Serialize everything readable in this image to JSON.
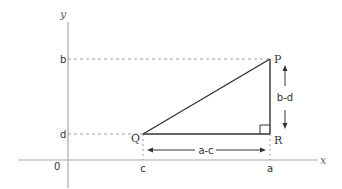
{
  "diagram": {
    "type": "right-triangle-coordinate-distance",
    "axes": {
      "x_label": "x",
      "y_label": "y",
      "origin_label": "0"
    },
    "ticks": {
      "x": [
        {
          "label": "c",
          "value_ref": "Q.x"
        },
        {
          "label": "a",
          "value_ref": "P.x"
        }
      ],
      "y": [
        {
          "label": "b",
          "value_ref": "P.y"
        },
        {
          "label": "d",
          "value_ref": "Q.y"
        }
      ]
    },
    "points": {
      "P": {
        "label": "P",
        "coords": "(a, b)"
      },
      "Q": {
        "label": "Q",
        "coords": "(c, d)"
      },
      "R": {
        "label": "R",
        "coords": "(a, d)"
      }
    },
    "dimensions": {
      "vertical": "b-d",
      "horizontal": "a-c"
    },
    "colors": {
      "axis": "#aaaaaa",
      "triangle": "#333333",
      "guide": "#888888",
      "text": "#333333"
    }
  }
}
